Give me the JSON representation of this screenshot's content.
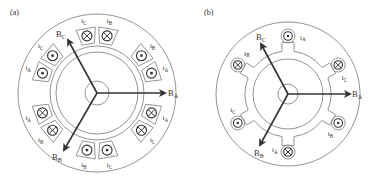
{
  "panels": [
    {
      "id": "a",
      "label": "(a)",
      "center": [
        97,
        93
      ],
      "radii": {
        "outer": 79,
        "stator_bore": 47,
        "rotor": 41,
        "shaft": 12,
        "slot_ring_outer": 66
      },
      "vectors": [
        {
          "name": "B_A",
          "main": "B",
          "sub": "A",
          "tip": [
            165,
            93
          ],
          "label_pos": [
            168,
            96
          ]
        },
        {
          "name": "B_B",
          "main": "B",
          "sub": "B",
          "tip": [
            64,
            150
          ],
          "label_pos": [
            52,
            160
          ]
        },
        {
          "name": "B_C",
          "main": "B",
          "sub": "C",
          "tip": [
            68,
            40
          ],
          "label_pos": [
            56,
            37
          ]
        }
      ],
      "coils": [
        {
          "angle": 100,
          "type": "cross",
          "current": "C"
        },
        {
          "angle": 80,
          "type": "cross",
          "current": "B"
        },
        {
          "angle": 40,
          "type": "dot",
          "current": "B"
        },
        {
          "angle": 20,
          "type": "dot",
          "current": "A"
        },
        {
          "angle": -20,
          "type": "cross",
          "current": "A"
        },
        {
          "angle": -40,
          "type": "cross",
          "current": "C"
        },
        {
          "angle": -80,
          "type": "dot",
          "current": "C"
        },
        {
          "angle": -100,
          "type": "dot",
          "current": "B"
        },
        {
          "angle": -140,
          "type": "cross",
          "current": "B"
        },
        {
          "angle": -160,
          "type": "cross",
          "current": "A"
        },
        {
          "angle": 160,
          "type": "dot",
          "current": "A"
        },
        {
          "angle": 140,
          "type": "dot",
          "current": "C"
        }
      ]
    },
    {
      "id": "b",
      "label": "(b)",
      "center": [
        288,
        94
      ],
      "radii": {
        "outer": 72,
        "stator_bore": 43,
        "rotor": 35,
        "shaft": 10,
        "slot_ring_outer": 52
      },
      "vectors": [
        {
          "name": "B_A",
          "main": "B",
          "sub": "A",
          "tip": [
            350,
            94
          ],
          "label_pos": [
            352,
            97
          ]
        },
        {
          "name": "B_B",
          "main": "B",
          "sub": "B",
          "tip": [
            260,
            145
          ],
          "label_pos": [
            254,
            156
          ]
        },
        {
          "name": "B_C",
          "main": "B",
          "sub": "C",
          "tip": [
            261,
            44
          ],
          "label_pos": [
            256,
            40
          ]
        }
      ],
      "coils": [
        {
          "angle": 90,
          "type": "dot",
          "current": "A"
        },
        {
          "angle": 30,
          "type": "cross",
          "current": "C"
        },
        {
          "angle": -30,
          "type": "dot",
          "current": "B"
        },
        {
          "angle": -90,
          "type": "cross",
          "current": "A"
        },
        {
          "angle": -150,
          "type": "dot",
          "current": "C"
        },
        {
          "angle": 150,
          "type": "cross",
          "current": "B"
        }
      ]
    }
  ],
  "colors": {
    "line": "#888888",
    "arrow": "#333333",
    "coil": "#333333",
    "text": "#333333"
  }
}
